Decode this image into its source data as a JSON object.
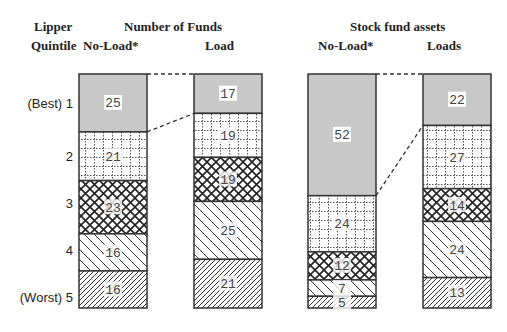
{
  "header": {
    "lipper": "Lipper",
    "quintile": "Quintile",
    "group1_title": "Number of Funds",
    "group1_col1": "No-Load*",
    "group1_col2": "Load",
    "group2_title": "Stock fund assets",
    "group2_col1": "No-Load*",
    "group2_col2": "Loads"
  },
  "quintile_labels": [
    "(Best) 1",
    "2",
    "3",
    "4",
    "(Worst) 5"
  ],
  "chart_data": {
    "type": "bar",
    "stacked": true,
    "normalized_percent": true,
    "categories": [
      "Lipper Quintile 1 (Best)",
      "Quintile 2",
      "Quintile 3",
      "Quintile 4",
      "Quintile 5 (Worst)"
    ],
    "groups": [
      {
        "title": "Number of Funds",
        "bars": [
          {
            "name": "No-Load*",
            "values": [
              25,
              21,
              23,
              16,
              16
            ]
          },
          {
            "name": "Load",
            "values": [
              17,
              19,
              19,
              25,
              21
            ]
          }
        ]
      },
      {
        "title": "Stock fund assets",
        "bars": [
          {
            "name": "No-Load*",
            "values": [
              52,
              24,
              12,
              7,
              5
            ]
          },
          {
            "name": "Loads",
            "values": [
              22,
              27,
              14,
              24,
              13
            ]
          }
        ]
      }
    ],
    "patterns": [
      "solid gray",
      "dotted grid",
      "crosshatch",
      "wide diagonal",
      "dense diagonal"
    ],
    "ylabel": "Lipper Quintile",
    "annotations": "Dashed lines connect the top-quintile boundaries of No-Load and Load bars"
  }
}
